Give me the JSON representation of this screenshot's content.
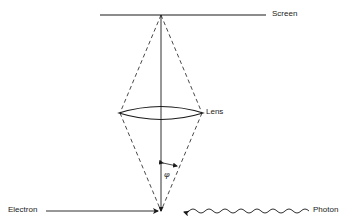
{
  "diagram": {
    "labels": {
      "screen": "Screen",
      "lens": "Lens",
      "electron": "Electron",
      "photon": "Photon",
      "angle": "φ"
    },
    "colors": {
      "line": "#1a1a1a",
      "background": "#ffffff"
    }
  }
}
